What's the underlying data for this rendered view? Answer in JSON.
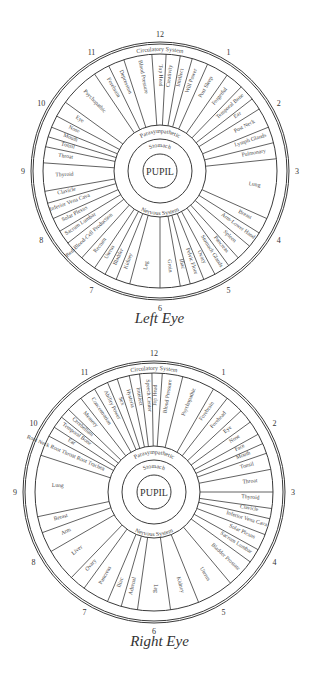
{
  "left_eye": {
    "caption": "Left Eye",
    "center": [
      160,
      171
    ],
    "outer_radius": 129,
    "band_radius": 117,
    "mid_radius": 46,
    "stomach_radius": 32,
    "pupil_radius": 17,
    "outer_band_label": "Circulatory System",
    "upper_mid_label": "Parasympathetic",
    "lower_mid_label": "Nervous System",
    "stomach_label": "Stomach",
    "pupil_label": "PUPIL",
    "clock_numbers": [
      "12",
      "1",
      "2",
      "3",
      "4",
      "5",
      "6",
      "7",
      "8",
      "9",
      "10",
      "11"
    ],
    "segments": [
      {
        "label": "Top Head",
        "start": -4,
        "end": 3
      },
      {
        "label": "Creativity",
        "start": 3,
        "end": 10
      },
      {
        "label": "Intellect",
        "start": 10,
        "end": 16
      },
      {
        "label": "Will Power",
        "start": 16,
        "end": 24
      },
      {
        "label": "Post Sleep",
        "start": 24,
        "end": 35
      },
      {
        "label": "Forgetful",
        "start": 35,
        "end": 44
      },
      {
        "label": "Temporal Bone",
        "start": 44,
        "end": 52
      },
      {
        "label": "Ear",
        "start": 52,
        "end": 58
      },
      {
        "label": "Post Neck",
        "start": 58,
        "end": 68
      },
      {
        "label": "Lymph Glands",
        "start": 68,
        "end": 76
      },
      {
        "label": "Pulmonary",
        "start": 76,
        "end": 84
      },
      {
        "label": "Lung",
        "start": 84,
        "end": 114
      },
      {
        "label": "Breast",
        "start": 114,
        "end": 122
      },
      {
        "label": "Arm-Lower Hand",
        "start": 122,
        "end": 130
      },
      {
        "label": "Spleen",
        "start": 130,
        "end": 138
      },
      {
        "label": "Pancreas",
        "start": 138,
        "end": 144
      },
      {
        "label": "Stomach Glands",
        "start": 144,
        "end": 152
      },
      {
        "label": "Ovary",
        "start": 152,
        "end": 158
      },
      {
        "label": "Pelvic Floor",
        "start": 158,
        "end": 165
      },
      {
        "label": "Iliac",
        "start": 165,
        "end": 170
      },
      {
        "label": "Groin",
        "start": 170,
        "end": 180
      },
      {
        "label": "Leg",
        "start": 180,
        "end": 195
      },
      {
        "label": "Kidney",
        "start": 195,
        "end": 202
      },
      {
        "label": "Bladder",
        "start": 202,
        "end": 208
      },
      {
        "label": "Uterus",
        "start": 208,
        "end": 214
      },
      {
        "label": "Rectum",
        "start": 214,
        "end": 222
      },
      {
        "label": "Red-Blood-Cell Production",
        "start": 222,
        "end": 232
      },
      {
        "label": "Sacrum Lumbar",
        "start": 232,
        "end": 239
      },
      {
        "label": "Solar Plexus",
        "start": 239,
        "end": 246
      },
      {
        "label": "Inferior Vena Cava",
        "start": 246,
        "end": 254
      },
      {
        "label": "Clavicle",
        "start": 254,
        "end": 260
      },
      {
        "label": "Thyroid",
        "start": 260,
        "end": 274
      },
      {
        "label": "Throat",
        "start": 274,
        "end": 282
      },
      {
        "label": "Tonsil",
        "start": 282,
        "end": 287
      },
      {
        "label": "Mouth",
        "start": 287,
        "end": 292
      },
      {
        "label": "Nose",
        "start": 292,
        "end": 298
      },
      {
        "label": "Eye",
        "start": 298,
        "end": 306
      },
      {
        "label": "Psychopathic",
        "start": 306,
        "end": 326
      },
      {
        "label": "Forebrain",
        "start": 326,
        "end": 334
      },
      {
        "label": "Depression",
        "start": 334,
        "end": 342
      },
      {
        "label": "Blood Pressure",
        "start": 342,
        "end": 356
      }
    ]
  },
  "right_eye": {
    "caption": "Right Eye",
    "center": [
      154,
      492
    ],
    "outer_radius": 131,
    "band_radius": 119,
    "mid_radius": 46,
    "stomach_radius": 32,
    "pupil_radius": 17,
    "outer_band_label": "Circulatory System",
    "upper_mid_label": "Parasympathetic",
    "lower_mid_label": "Nervous System",
    "stomach_label": "Stomach",
    "pupil_label": "PUPIL",
    "clock_numbers": [
      "12",
      "1",
      "2",
      "3",
      "4",
      "5",
      "6",
      "7",
      "8",
      "9",
      "10",
      "11"
    ],
    "segments": [
      {
        "label": "Blood Pressure",
        "start": 4,
        "end": 14
      },
      {
        "label": "Psychopathic",
        "start": 14,
        "end": 30
      },
      {
        "label": "Forebrain",
        "start": 30,
        "end": 38
      },
      {
        "label": "Forehead",
        "start": 38,
        "end": 47
      },
      {
        "label": "Eye",
        "start": 47,
        "end": 54
      },
      {
        "label": "Nose",
        "start": 54,
        "end": 61
      },
      {
        "label": "Face",
        "start": 61,
        "end": 66
      },
      {
        "label": "Mouth",
        "start": 66,
        "end": 71
      },
      {
        "label": "Tonsil",
        "start": 71,
        "end": 79
      },
      {
        "label": "Throat",
        "start": 79,
        "end": 90
      },
      {
        "label": "Thyroid",
        "start": 90,
        "end": 98
      },
      {
        "label": "Clavicle",
        "start": 98,
        "end": 103
      },
      {
        "label": "Inferior Vena Cava",
        "start": 103,
        "end": 111
      },
      {
        "label": "Solar Plexus",
        "start": 111,
        "end": 119
      },
      {
        "label": "Sacrum Lumbar",
        "start": 119,
        "end": 126
      },
      {
        "label": "Bladder Prostate",
        "start": 126,
        "end": 140
      },
      {
        "label": "Uterus",
        "start": 140,
        "end": 158
      },
      {
        "label": "Kidney",
        "start": 158,
        "end": 172
      },
      {
        "label": "Leg",
        "start": 172,
        "end": 188
      },
      {
        "label": "Adrenal",
        "start": 188,
        "end": 196
      },
      {
        "label": "Iliac",
        "start": 196,
        "end": 203
      },
      {
        "label": "Pancreas",
        "start": 203,
        "end": 216
      },
      {
        "label": "Ovary",
        "start": 216,
        "end": 224
      },
      {
        "label": "Liver",
        "start": 224,
        "end": 240
      },
      {
        "label": "Arm",
        "start": 240,
        "end": 250
      },
      {
        "label": "Breast",
        "start": 250,
        "end": 258
      },
      {
        "label": "Lung",
        "start": 258,
        "end": 288
      },
      {
        "label": "Root Neck Root Throat Root Trachea",
        "start": 288,
        "end": 298
      },
      {
        "label": "Ear",
        "start": 298,
        "end": 303
      },
      {
        "label": "Temporal Bone",
        "start": 303,
        "end": 309
      },
      {
        "label": "Cerebellum",
        "start": 309,
        "end": 314
      },
      {
        "label": "Memory",
        "start": 314,
        "end": 322
      },
      {
        "label": "Concentration",
        "start": 322,
        "end": 330
      },
      {
        "label": "Ability Power",
        "start": 330,
        "end": 337
      },
      {
        "label": "Sex",
        "start": 337,
        "end": 342
      },
      {
        "label": "Hysteria",
        "start": 342,
        "end": 348
      },
      {
        "label": "Intellect",
        "start": 348,
        "end": 353
      },
      {
        "label": "Speech Center",
        "start": 353,
        "end": 359
      },
      {
        "label": "Top Head",
        "start": 359,
        "end": 364
      }
    ]
  }
}
